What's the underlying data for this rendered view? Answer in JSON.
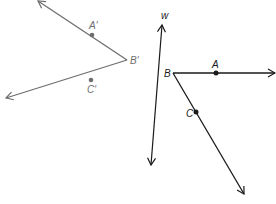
{
  "diagram": {
    "colors": {
      "image": "#6e6e6e",
      "original": "#1a1a1a",
      "background": "#ffffff"
    },
    "image_angle": {
      "vertex": {
        "label": "B′",
        "x": 127,
        "y": 60
      },
      "points": [
        {
          "label": "A′",
          "x": 92,
          "y": 35
        },
        {
          "label": "C′",
          "x": 91,
          "y": 80
        }
      ],
      "rays": [
        {
          "from": [
            127,
            60
          ],
          "to": [
            38,
            1
          ]
        },
        {
          "from": [
            127,
            60
          ],
          "to": [
            6,
            98
          ]
        }
      ]
    },
    "mirror_line": {
      "label": "w",
      "from": [
        151,
        165
      ],
      "to": [
        162,
        25
      ]
    },
    "original_angle": {
      "vertex": {
        "label": "B",
        "x": 173,
        "y": 73
      },
      "points": [
        {
          "label": "A",
          "x": 216,
          "y": 73
        },
        {
          "label": "C",
          "x": 196,
          "y": 112
        }
      ],
      "rays": [
        {
          "from": [
            173,
            73
          ],
          "to": [
            275,
            73
          ]
        },
        {
          "from": [
            173,
            73
          ],
          "to": [
            244,
            194
          ]
        }
      ]
    }
  }
}
